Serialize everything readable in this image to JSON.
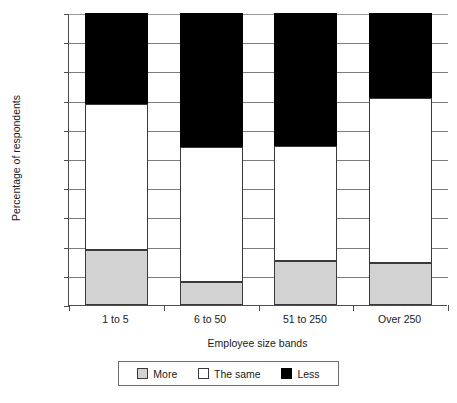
{
  "chart_data": {
    "type": "bar",
    "title": "",
    "xlabel": "Employee size bands",
    "ylabel": "Percentage of respondents",
    "categories": [
      "1 to 5",
      "6 to 50",
      "51 to 250",
      "Over 250"
    ],
    "series": [
      {
        "name": "More",
        "color": "#d2d2d2",
        "values": [
          19,
          8,
          15,
          14.5
        ]
      },
      {
        "name": "The same",
        "color": "#ffffff",
        "values": [
          50,
          46,
          39.5,
          56.5
        ]
      },
      {
        "name": "Less",
        "color": "#000000",
        "values": [
          31,
          46,
          45.5,
          29
        ]
      }
    ],
    "stacked": true,
    "ylim": [
      0,
      100
    ],
    "yticks": [
      "0%",
      "10%",
      "20%",
      "30%",
      "40%",
      "50%",
      "60%",
      "70%",
      "80%",
      "90%",
      "100%"
    ],
    "ytick_values": [
      0,
      10,
      20,
      30,
      40,
      50,
      60,
      70,
      80,
      90,
      100
    ],
    "grid": true,
    "legend_position": "bottom",
    "cumulative_tops": {
      "1 to 5": {
        "more": 19,
        "same": 69,
        "less": 100
      },
      "6 to 50": {
        "more": 8,
        "same": 54,
        "less": 100
      },
      "51 to 250": {
        "more": 15,
        "same": 54.5,
        "less": 100
      },
      "Over 250": {
        "more": 14.5,
        "same": 71,
        "less": 100
      }
    }
  },
  "legend": {
    "items": [
      {
        "label": "More"
      },
      {
        "label": "The same"
      },
      {
        "label": "Less"
      }
    ]
  }
}
